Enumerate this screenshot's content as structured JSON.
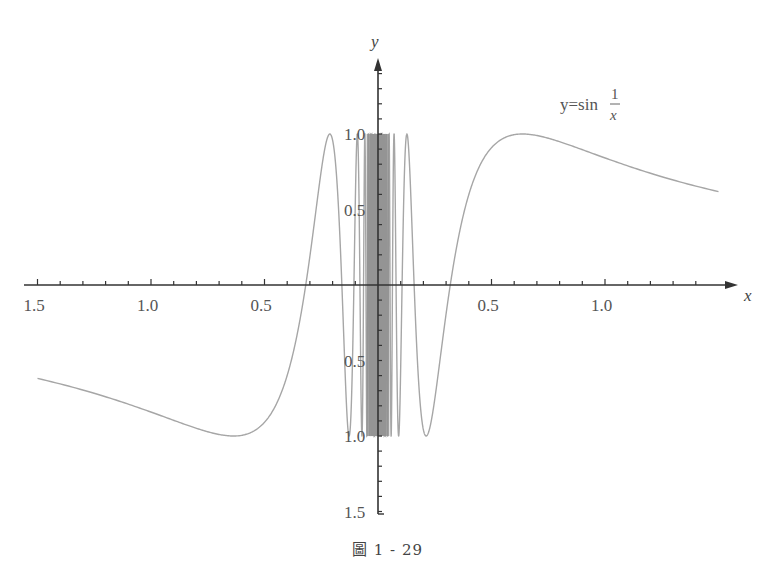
{
  "chart_data": {
    "type": "line",
    "title": "",
    "function": "y = sin(1/x)",
    "legend_formula": {
      "lhs": "y=sin",
      "numerator": "1",
      "denominator": "x"
    },
    "xlabel": "x",
    "ylabel": "y",
    "xlim": [
      -1.5,
      1.5
    ],
    "ylim": [
      -1.5,
      1.5
    ],
    "x_tick_labels": [
      {
        "value": -1.5,
        "text": "1.5"
      },
      {
        "value": -1.0,
        "text": "1.0"
      },
      {
        "value": -0.5,
        "text": "0.5"
      },
      {
        "value": 0.5,
        "text": "0.5"
      },
      {
        "value": 1.0,
        "text": "1.0"
      }
    ],
    "y_tick_labels": [
      {
        "value": 1.0,
        "text": "1.0"
      },
      {
        "value": 0.5,
        "text": "0.5"
      },
      {
        "value": -0.5,
        "text": "0.5"
      },
      {
        "value": -1.0,
        "text": "1.0"
      },
      {
        "value": -1.5,
        "text": "1.5"
      }
    ],
    "minor_tick_step": 0.1,
    "grid": false,
    "sample_points": [
      {
        "x": -1.5,
        "y": -0.618
      },
      {
        "x": -0.637,
        "y": -1.0
      },
      {
        "x": -0.318,
        "y": 0.0
      },
      {
        "x": -0.212,
        "y": 1.0
      },
      {
        "x": 0.212,
        "y": -1.0
      },
      {
        "x": 0.318,
        "y": 0.0
      },
      {
        "x": 0.637,
        "y": 1.0
      },
      {
        "x": 1.5,
        "y": 0.618
      }
    ],
    "colors": {
      "curve": "#a6a6a6",
      "axis": "#333333",
      "text": "#555555"
    }
  },
  "caption": "圖 1 - 29",
  "layout": {
    "origin_px": [
      378,
      285
    ],
    "x_scale_px_per_unit": 227,
    "y_scale_px_per_unit": 151,
    "x_axis_start_px": 24,
    "x_axis_end_px": 738,
    "y_axis_top_px": 58,
    "y_axis_bottom_px": 514,
    "curve_x_range": [
      -1.5,
      1.5
    ]
  }
}
